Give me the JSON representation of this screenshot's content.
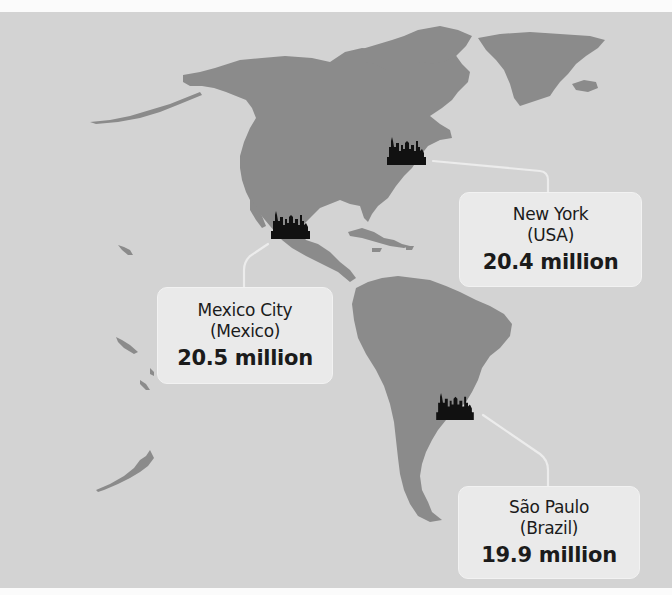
{
  "map": {
    "region": "Americas",
    "colors": {
      "ocean": "#d3d3d3",
      "land": "#8b8b8b",
      "callout_bg": "#eaeaea",
      "connector": "#ececec",
      "icon": "#111111"
    }
  },
  "markers": [
    {
      "icon": "city-skyline-icon",
      "city": "New York",
      "country": "(USA)",
      "population": "20.4 million"
    },
    {
      "icon": "city-skyline-icon",
      "city": "Mexico City",
      "country": "(Mexico)",
      "population": "20.5 million"
    },
    {
      "icon": "city-skyline-icon",
      "city": "São Paulo",
      "country": "(Brazil)",
      "population": "19.9 million"
    }
  ]
}
